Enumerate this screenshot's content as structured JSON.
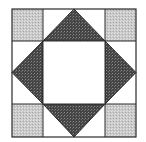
{
  "diagram": {
    "type": "quilt-block",
    "grid": {
      "x": [
        12,
        43,
        105,
        136
      ],
      "y": [
        9,
        41,
        104,
        137
      ]
    },
    "colors": {
      "background": "#ffffff",
      "corner_fill": "#c8c8c8",
      "triangle_fill": "#4a4a4a",
      "center_fill": "#ffffff",
      "stroke": "#2a2a2a"
    },
    "pieces": {
      "corner_squares": [
        "top-left",
        "top-right",
        "bottom-left",
        "bottom-right"
      ],
      "triangles": [
        "top",
        "right",
        "bottom",
        "left"
      ],
      "center_square": "center"
    }
  }
}
